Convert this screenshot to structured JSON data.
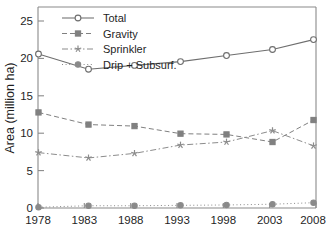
{
  "chart_data": {
    "type": "line",
    "title": "",
    "xlabel": "",
    "ylabel": "Area (million ha)",
    "x": [
      1978,
      1983,
      1988,
      1993,
      1998,
      2003,
      2008
    ],
    "categories": [
      "1978",
      "1983",
      "1988",
      "1993",
      "1998",
      "2003",
      "2008"
    ],
    "xtick_labels": [
      "1978",
      "1983",
      "1988",
      "1993",
      "1998",
      "2003",
      "2008"
    ],
    "ytick_labels": [
      "0",
      "5",
      "10",
      "15",
      "20",
      "25"
    ],
    "ytick_values": [
      0,
      5,
      10,
      15,
      20,
      25
    ],
    "xlim": [
      1978,
      2008
    ],
    "ylim": [
      0,
      26.5
    ],
    "grid": false,
    "legend_position": "top-left",
    "series": [
      {
        "name": "Total",
        "values": [
          20.3,
          18.3,
          18.8,
          19.3,
          20.1,
          20.9,
          22.2
        ],
        "color": "#6e6e6e",
        "marker": "open-circle",
        "dash": "none"
      },
      {
        "name": "Gravity",
        "values": [
          12.6,
          11.0,
          10.8,
          9.8,
          9.7,
          8.7,
          11.6
        ],
        "color": "#808080",
        "marker": "filled-square",
        "dash": "dashed"
      },
      {
        "name": "Sprinkler",
        "values": [
          7.3,
          6.6,
          7.2,
          8.3,
          8.7,
          10.2,
          8.2
        ],
        "color": "#8c8c8c",
        "marker": "star",
        "dash": "dash-dot"
      },
      {
        "name": "Drip + Subsurf.",
        "values": [
          0.1,
          0.3,
          0.3,
          0.35,
          0.4,
          0.5,
          0.7
        ],
        "color": "#8a8a8a",
        "marker": "filled-circle",
        "dash": "dotted"
      }
    ]
  },
  "legend": {
    "items": [
      {
        "label": "Total"
      },
      {
        "label": "Gravity"
      },
      {
        "label": "Sprinkler"
      },
      {
        "label": "Drip + Subsurf."
      }
    ]
  },
  "axes": {
    "y_axis_title": "Area (million ha)"
  }
}
